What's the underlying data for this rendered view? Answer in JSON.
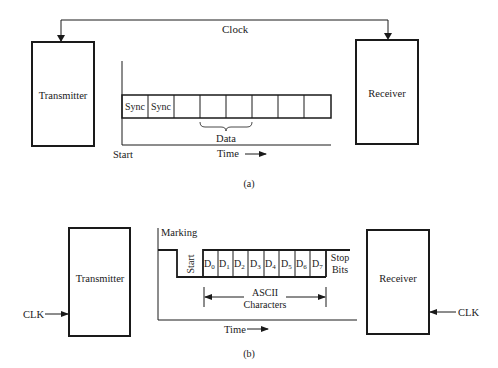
{
  "figure_a": {
    "caption": "(a)",
    "transmitter_label": "Transmitter",
    "receiver_label": "Receiver",
    "clock_label": "Clock",
    "frame_cells": [
      "Sync",
      "Sync",
      "",
      "",
      "",
      "",
      "",
      ""
    ],
    "data_label": "Data",
    "start_label": "Start",
    "time_label": "Time"
  },
  "figure_b": {
    "caption": "(b)",
    "transmitter_label": "Transmitter",
    "receiver_label": "Receiver",
    "clk_left_label": "CLK",
    "clk_right_label": "CLK",
    "marking_label": "Marking",
    "start_bit_label": "Start",
    "data_bits": [
      {
        "base": "D",
        "sub": "0"
      },
      {
        "base": "D",
        "sub": "1"
      },
      {
        "base": "D",
        "sub": "2"
      },
      {
        "base": "D",
        "sub": "3"
      },
      {
        "base": "D",
        "sub": "4"
      },
      {
        "base": "D",
        "sub": "5"
      },
      {
        "base": "D",
        "sub": "6"
      },
      {
        "base": "D",
        "sub": "7"
      }
    ],
    "stop_label_line1": "Stop",
    "stop_label_line2": "Bits",
    "ascii_label_line1": "ASCII",
    "ascii_label_line2": "Characters",
    "time_label": "Time"
  }
}
